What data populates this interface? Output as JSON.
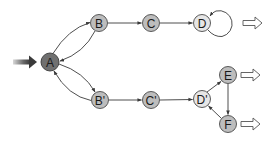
{
  "diagram": {
    "type": "state-transition-graph",
    "colors": {
      "background": "#ffffff",
      "node_dark": "#707070",
      "node_medium": "#bdbdbd",
      "node_light": "#e6e6e6",
      "node_stroke": "#4a4a4a",
      "edge": "#3a3a3a",
      "output_arrow_stroke": "#555555"
    },
    "nodes": [
      {
        "id": "A",
        "label": "A",
        "x": 50,
        "y": 62,
        "r": 9,
        "shade": "dark"
      },
      {
        "id": "B",
        "label": "B",
        "x": 99,
        "y": 23,
        "r": 8.5,
        "shade": "medium"
      },
      {
        "id": "C",
        "label": "C",
        "x": 151,
        "y": 23,
        "r": 8.5,
        "shade": "medium"
      },
      {
        "id": "D",
        "label": "D",
        "x": 202,
        "y": 23,
        "r": 8.5,
        "shade": "light"
      },
      {
        "id": "B'",
        "label": "B'",
        "x": 100,
        "y": 100,
        "r": 8.5,
        "shade": "medium"
      },
      {
        "id": "C'",
        "label": "C'",
        "x": 151,
        "y": 100,
        "r": 8.5,
        "shade": "medium"
      },
      {
        "id": "D'",
        "label": "D'",
        "x": 202,
        "y": 99,
        "r": 8.5,
        "shade": "light"
      },
      {
        "id": "E",
        "label": "E",
        "x": 228,
        "y": 75,
        "r": 8.5,
        "shade": "medium"
      },
      {
        "id": "F",
        "label": "F",
        "x": 228,
        "y": 124,
        "r": 8.5,
        "shade": "medium"
      }
    ],
    "edges": [
      {
        "from": "A",
        "to": "B",
        "style": "curved"
      },
      {
        "from": "B",
        "to": "A",
        "style": "curved"
      },
      {
        "from": "A",
        "to": "B'",
        "style": "curved"
      },
      {
        "from": "B'",
        "to": "A",
        "style": "curved"
      },
      {
        "from": "B",
        "to": "C",
        "style": "straight"
      },
      {
        "from": "C",
        "to": "D",
        "style": "straight"
      },
      {
        "from": "D",
        "to": "D",
        "style": "self-loop"
      },
      {
        "from": "B'",
        "to": "C'",
        "style": "straight"
      },
      {
        "from": "C'",
        "to": "D'",
        "style": "straight"
      },
      {
        "from": "D'",
        "to": "E",
        "style": "straight"
      },
      {
        "from": "E",
        "to": "F",
        "style": "straight"
      },
      {
        "from": "F",
        "to": "D'",
        "style": "straight"
      }
    ],
    "entry_arrow": {
      "target": "A",
      "description": "thick shaded input arrow"
    },
    "output_arrows": [
      {
        "from": "D",
        "description": "hollow double-line output arrow"
      },
      {
        "from": "E",
        "description": "hollow double-line output arrow"
      },
      {
        "from": "F",
        "description": "hollow double-line output arrow"
      }
    ]
  }
}
